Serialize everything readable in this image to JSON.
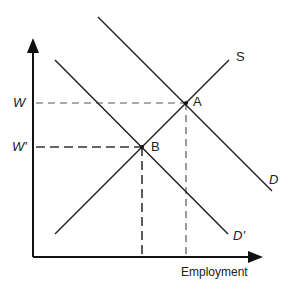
{
  "diagram": {
    "type": "labor-market-supply-demand",
    "axes": {
      "x_label": "Employment",
      "y_label": ""
    },
    "curves": [
      {
        "id": "S",
        "label": "S",
        "kind": "supply",
        "from": [
          55,
          234
        ],
        "to": [
          229,
          60
        ]
      },
      {
        "id": "D",
        "label": "D",
        "kind": "demand",
        "from": [
          98,
          17
        ],
        "to": [
          272,
          191
        ]
      },
      {
        "id": "Dprime",
        "label": "D'",
        "kind": "demand",
        "from": [
          55,
          60
        ],
        "to": [
          228,
          234
        ]
      }
    ],
    "points": [
      {
        "id": "A",
        "label": "A",
        "x": 186,
        "y": 103
      },
      {
        "id": "B",
        "label": "B",
        "x": 142,
        "y": 147
      }
    ],
    "wage_levels": [
      {
        "id": "W",
        "label": "W",
        "y": 103
      },
      {
        "id": "Wprime",
        "label": "W'",
        "y": 147
      }
    ],
    "colors": {
      "line": "#222222",
      "dashed": "#444444",
      "background": "#ffffff"
    }
  }
}
